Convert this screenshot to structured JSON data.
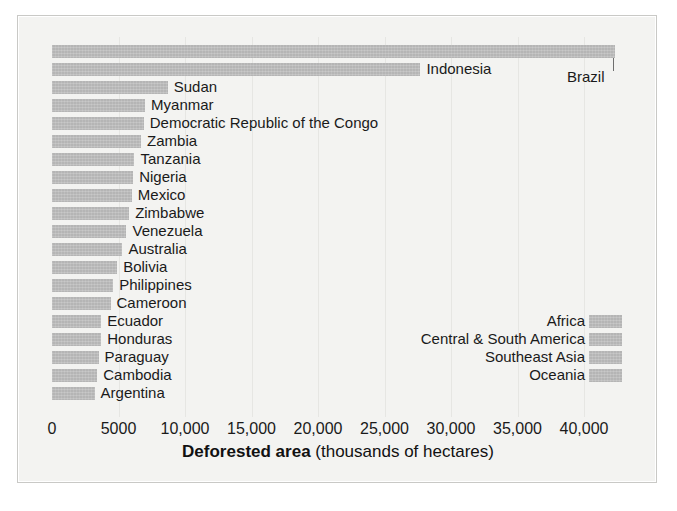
{
  "chart_data": {
    "type": "bar",
    "orientation": "horizontal",
    "title": "",
    "xlabel": "Deforested area (thousands of hectares)",
    "xlabel_bold_part": "Deforested area",
    "xlabel_plain_part": " (thousands of hectares)",
    "ylabel": "",
    "xlim": [
      0,
      45000
    ],
    "xticks": [
      0,
      5000,
      10000,
      15000,
      20000,
      25000,
      30000,
      35000,
      40000
    ],
    "xtick_labels": [
      "0",
      "5000",
      "10,000",
      "15,000",
      "20,000",
      "25,000",
      "30,000",
      "35,000",
      "40,000"
    ],
    "grid": true,
    "grid_axis": "x",
    "bar_color": "#b5b5b5",
    "legend_position": "inside-right",
    "categories": [
      "Brazil",
      "Indonesia",
      "Sudan",
      "Myanmar",
      "Democratic Republic of the Congo",
      "Zambia",
      "Tanzania",
      "Nigeria",
      "Mexico",
      "Zimbabwe",
      "Venezuela",
      "Australia",
      "Bolivia",
      "Philippines",
      "Cameroon",
      "Ecuador",
      "Honduras",
      "Paraguay",
      "Cambodia",
      "Argentina"
    ],
    "values": [
      42330,
      27700,
      8700,
      7000,
      6900,
      6700,
      6200,
      6100,
      6000,
      5800,
      5600,
      5300,
      4900,
      4600,
      4400,
      3700,
      3700,
      3500,
      3400,
      3200
    ],
    "legend": {
      "entries": [
        "Africa",
        "Central & South America",
        "Southeast Asia",
        "Oceania"
      ]
    }
  },
  "axis": {
    "title_bold": "Deforested area",
    "title_rest": " (thousands of hectares)"
  }
}
